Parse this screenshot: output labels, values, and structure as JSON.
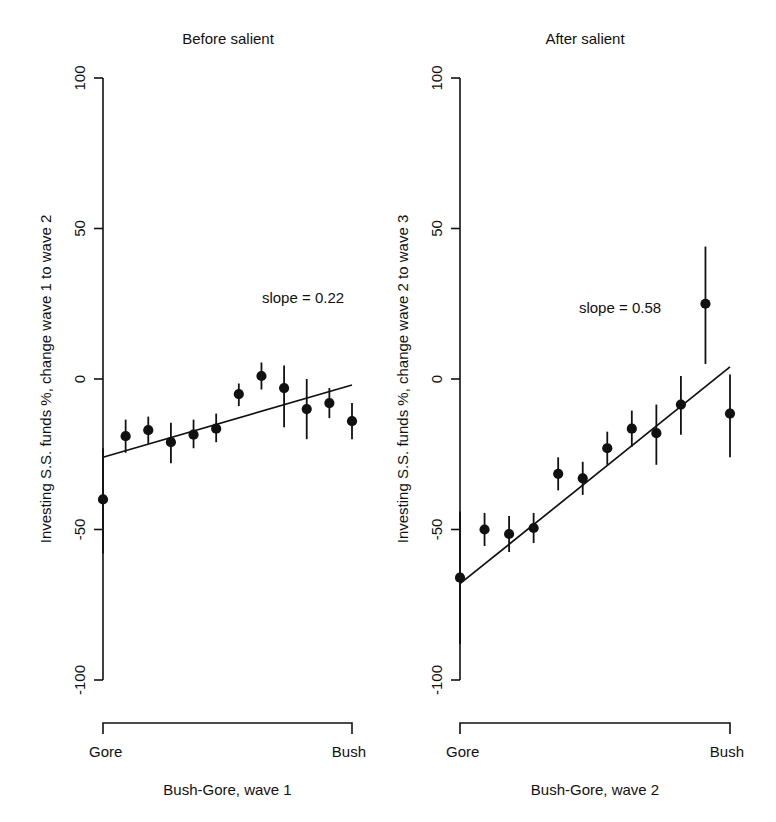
{
  "figure": {
    "background": "#ffffff",
    "ink_color": "#111111",
    "width": 776,
    "height": 822
  },
  "chart_data": [
    {
      "type": "scatter",
      "title": "Before salient",
      "xlabel": "Bush-Gore, wave 1",
      "ylabel": "Investing S.S. funds %, change wave 1 to wave 2",
      "ylim": [
        -100,
        100
      ],
      "yticks": [
        100,
        50,
        0,
        -50,
        -100
      ],
      "ytick_labels": [
        "100",
        "50",
        "0",
        "-50",
        "-100"
      ],
      "xlim": [
        0,
        11
      ],
      "x_end_labels": [
        "Gore",
        "Bush"
      ],
      "grid": false,
      "legend": false,
      "annotation": "slope = 0.22",
      "slope": 0.22,
      "x": [
        0,
        1,
        2,
        3,
        4,
        5,
        6,
        7,
        8,
        9,
        10,
        11
      ],
      "values": [
        -40.0,
        -19.0,
        -17.0,
        -21.0,
        -18.5,
        -16.5,
        -5.0,
        1.0,
        -3.0,
        -10.0,
        -8.0,
        -14.0
      ],
      "err_low": [
        -58.0,
        -24.5,
        -21.5,
        -28.0,
        -23.0,
        -21.0,
        -9.0,
        -3.5,
        -16.0,
        -20.0,
        -13.0,
        -20.0
      ],
      "err_high": [
        -23.0,
        -13.5,
        -12.5,
        -14.5,
        -13.5,
        -11.5,
        -1.5,
        5.5,
        4.5,
        0.0,
        -3.0,
        -8.0
      ],
      "fit_line": {
        "x0": 0,
        "y0": -26.0,
        "x1": 11,
        "y1": -2.0
      }
    },
    {
      "type": "scatter",
      "title": "After salient",
      "xlabel": "Bush-Gore, wave 2",
      "ylabel": "Investing S.S. funds %, change wave 2 to wave 3",
      "ylim": [
        -100,
        100
      ],
      "yticks": [
        100,
        50,
        0,
        -50,
        -100
      ],
      "ytick_labels": [
        "100",
        "50",
        "0",
        "-50",
        "-100"
      ],
      "xlim": [
        0,
        11
      ],
      "x_end_labels": [
        "Gore",
        "Bush"
      ],
      "grid": false,
      "legend": false,
      "annotation": "slope = 0.58",
      "slope": 0.58,
      "x": [
        0,
        1,
        2,
        3,
        4,
        5,
        6,
        7,
        8,
        9,
        10,
        11
      ],
      "values": [
        -66.0,
        -50.0,
        -51.5,
        -49.5,
        -31.5,
        -33.0,
        -23.0,
        -16.5,
        -18.0,
        -8.5,
        25.0,
        -11.5
      ],
      "err_low": [
        -88.0,
        -55.5,
        -57.5,
        -54.5,
        -37.0,
        -38.5,
        -28.5,
        -22.5,
        -28.5,
        -18.5,
        5.0,
        -26.0
      ],
      "err_high": [
        -44.0,
        -44.5,
        -45.5,
        -44.5,
        -26.0,
        -27.5,
        -17.5,
        -10.5,
        -8.5,
        1.0,
        44.0,
        1.5
      ],
      "fit_line": {
        "x0": 0,
        "y0": -68.0,
        "x1": 11,
        "y1": 4.0
      }
    }
  ],
  "panels": {
    "geometry": {
      "left": {
        "axis_x": 103,
        "x_start": 103,
        "x_end": 352,
        "title_x": 228
      },
      "right": {
        "axis_x": 460,
        "x_start": 460,
        "x_end": 730,
        "title_x": 585
      },
      "y_top_px": 78,
      "y_bottom_px": 680,
      "bracket_y": 723,
      "end_label_y": 757,
      "axis_title_y": 795,
      "title_y": 44,
      "annot_left": {
        "x": 303,
        "y": 303
      },
      "annot_right": {
        "x": 620,
        "y": 313
      }
    }
  }
}
